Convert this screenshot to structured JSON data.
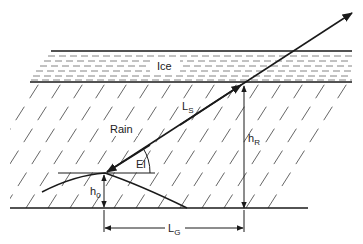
{
  "diagram": {
    "colors": {
      "line": "#1a1a1a",
      "hatch": "#555555",
      "background": "#ffffff"
    },
    "labels": {
      "ice": "Ice",
      "rain": "Rain",
      "slant_path": {
        "main": "L",
        "sub": "S"
      },
      "elevation": "El",
      "rain_height": {
        "main": "h",
        "sub": "R"
      },
      "station_height": {
        "main": "h",
        "sub": "0"
      },
      "ground_distance": {
        "main": "L",
        "sub": "G"
      }
    }
  }
}
